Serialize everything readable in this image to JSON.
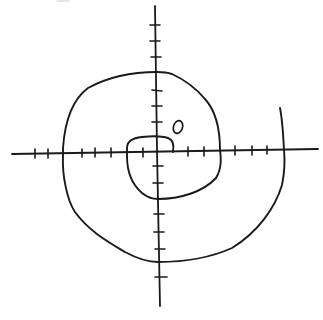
{
  "diagram": {
    "title": "",
    "type": "hand-drawn spiral on coordinate axes",
    "ink_color": "#1a1a1a",
    "background_color": "#ffffff",
    "origin_label": "O",
    "axes": {
      "horizontal": {
        "from": [
          12,
          153
        ],
        "to": [
          318,
          150
        ]
      },
      "vertical": {
        "from": [
          155,
          5
        ],
        "to": [
          160,
          305
        ]
      },
      "x_ticks": [
        35,
        48,
        63,
        82,
        95,
        111,
        127,
        143,
        173,
        188,
        204,
        220,
        235,
        252,
        267,
        284
      ],
      "y_ticks_above": [
        25,
        41,
        57,
        72,
        90,
        106,
        122,
        137
      ],
      "y_ticks_below": [
        166,
        183,
        199,
        214,
        232,
        249,
        262,
        277
      ]
    },
    "spiral": {
      "description": "Clockwise Archimedean-style spiral starting near origin, crossing axes at increasing radii",
      "axis_crossings": [
        {
          "axis": "y+",
          "point": [
            157,
            136
          ]
        },
        {
          "axis": "x+",
          "point": [
            173,
            152
          ]
        },
        {
          "axis": "x-",
          "point": [
            127,
            153
          ]
        },
        {
          "axis": "y-",
          "point": [
            158,
            199
          ]
        },
        {
          "axis": "x+",
          "point": [
            220,
            150
          ]
        },
        {
          "axis": "y+",
          "point": [
            157,
            72
          ]
        },
        {
          "axis": "x-",
          "point": [
            63,
            153
          ]
        },
        {
          "axis": "y-",
          "point": [
            158,
            262
          ]
        },
        {
          "axis": "x+",
          "point": [
            284,
            150
          ]
        }
      ],
      "end_point": [
        280,
        108
      ]
    }
  }
}
